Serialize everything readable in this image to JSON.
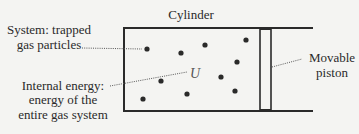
{
  "diagram": {
    "title": "Cylinder",
    "labels": {
      "system_line1": "System: trapped",
      "system_line2": "gas particles",
      "energy_line1": "Internal energy:",
      "energy_line2": "energy of the",
      "energy_line3": "entire gas system",
      "piston_line1": "Movable",
      "piston_line2": "piston",
      "internal_energy_symbol": "U"
    },
    "particles": [
      {
        "x": 147,
        "y": 49
      },
      {
        "x": 181,
        "y": 53
      },
      {
        "x": 205,
        "y": 45
      },
      {
        "x": 246,
        "y": 40
      },
      {
        "x": 237,
        "y": 62
      },
      {
        "x": 221,
        "y": 77
      },
      {
        "x": 161,
        "y": 81
      },
      {
        "x": 143,
        "y": 99
      },
      {
        "x": 187,
        "y": 94
      },
      {
        "x": 235,
        "y": 91
      }
    ],
    "colors": {
      "line": "#2a2a2a",
      "background": "#f4f4f2"
    }
  }
}
